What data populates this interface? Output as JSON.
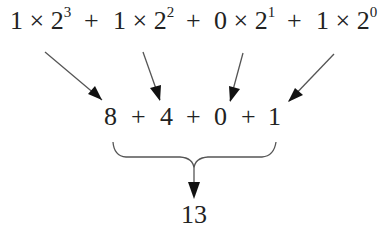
{
  "diagram": {
    "top_terms": [
      {
        "coef": "1",
        "times": "×",
        "base": "2",
        "exp": "3"
      },
      {
        "coef": "1",
        "times": "×",
        "base": "2",
        "exp": "2"
      },
      {
        "coef": "0",
        "times": "×",
        "base": "2",
        "exp": "1"
      },
      {
        "coef": "1",
        "times": "×",
        "base": "2",
        "exp": "0"
      }
    ],
    "top_plus": [
      "+",
      "+",
      "+"
    ],
    "middle_values": [
      "8",
      "4",
      "0",
      "1"
    ],
    "middle_plus": [
      "+",
      "+",
      "+"
    ],
    "result": "13",
    "colors": {
      "text": "#222222",
      "arrow": "#111111",
      "line": "#555555"
    }
  }
}
